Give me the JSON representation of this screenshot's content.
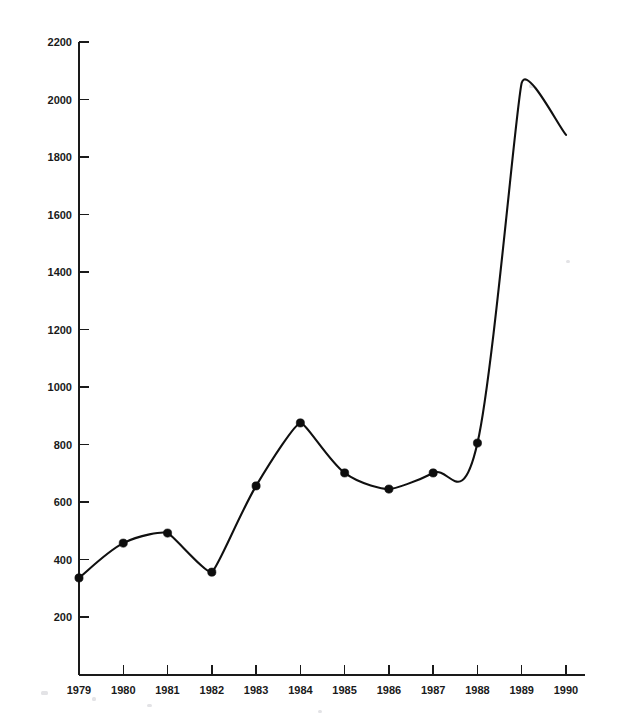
{
  "chart_data": {
    "type": "line",
    "title": "",
    "subtitle": "",
    "xlabel": "",
    "ylabel": "",
    "categories": [
      "1979",
      "1980",
      "1981",
      "1982",
      "1983",
      "1984",
      "1985",
      "1986",
      "1987",
      "1988",
      "1989",
      "1990"
    ],
    "values": [
      336,
      457,
      492,
      356,
      656,
      875,
      701,
      645,
      701,
      805,
      2058,
      1877
    ],
    "series": [
      {
        "name": "",
        "values": [
          336,
          457,
          492,
          356,
          656,
          875,
          701,
          645,
          701,
          805,
          2058,
          1877
        ]
      }
    ],
    "ylim": [
      0,
      2200
    ],
    "xlim": [
      "1979",
      "1990"
    ],
    "y_ticks": [
      200,
      400,
      600,
      800,
      1000,
      1200,
      1400,
      1600,
      1800,
      2000,
      2200
    ],
    "y_tick_labels": [
      "200",
      "400",
      "600",
      "800",
      "1000",
      "1200",
      "1400",
      "1600",
      "1800",
      "2000",
      "2200"
    ],
    "x_ticks": [
      "1979",
      "1980",
      "1981",
      "1982",
      "1983",
      "1984",
      "1985",
      "1986",
      "1987",
      "1988",
      "1989",
      "1990"
    ],
    "grid": false,
    "legend": false,
    "legend_position": "none",
    "markers": "filled-circle",
    "interpolation": "smooth",
    "line_color": "#101010",
    "marker_color": "#0d0d0d",
    "background_color": "#ffffff",
    "annotations": []
  },
  "figure": {
    "title_text": "",
    "title_state": "clipped-at-top-edge"
  },
  "colors": {
    "ink": "#1a1a1a",
    "line": "#101010",
    "background": "#ffffff"
  }
}
